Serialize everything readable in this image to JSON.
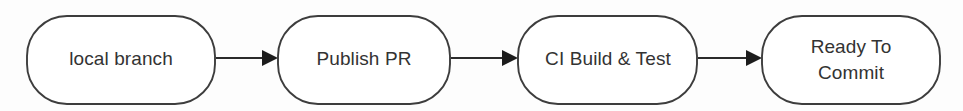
{
  "diagram": {
    "type": "flowchart",
    "orientation": "left-to-right",
    "background_color": "#fdfdfd",
    "node_fill_color": "#ffffff",
    "node_stroke_color": "#3d3d3d",
    "text_color": "#333333",
    "arrow_color": "#1c1c1c",
    "nodes": [
      {
        "id": "local-branch",
        "label": "local branch",
        "lines": [
          "local branch"
        ],
        "shape": "rounded-rectangle",
        "x": 27,
        "y": 16,
        "width": 188,
        "height": 88
      },
      {
        "id": "publish-pr",
        "label": "Publish PR",
        "lines": [
          "Publish PR"
        ],
        "shape": "rounded-rectangle",
        "x": 278,
        "y": 16,
        "width": 172,
        "height": 88
      },
      {
        "id": "ci-build-test",
        "label": "CI Build & Test",
        "lines": [
          "CI Build & Test"
        ],
        "shape": "rounded-rectangle",
        "x": 518,
        "y": 16,
        "width": 179,
        "height": 88
      },
      {
        "id": "ready-to-commit",
        "label": "Ready To Commit",
        "lines": [
          "Ready To",
          "Commit"
        ],
        "shape": "rounded-rectangle",
        "x": 762,
        "y": 16,
        "width": 178,
        "height": 88
      }
    ],
    "edges": [
      {
        "id": "edge-1",
        "from": "local-branch",
        "to": "publish-pr",
        "label": "",
        "x1": 216,
        "x2": 277,
        "y": 58
      },
      {
        "id": "edge-2",
        "from": "publish-pr",
        "to": "ci-build-test",
        "label": "",
        "x1": 451,
        "x2": 517,
        "y": 58
      },
      {
        "id": "edge-3",
        "from": "ci-build-test",
        "to": "ready-to-commit",
        "label": "",
        "x1": 698,
        "x2": 761,
        "y": 58
      }
    ]
  }
}
